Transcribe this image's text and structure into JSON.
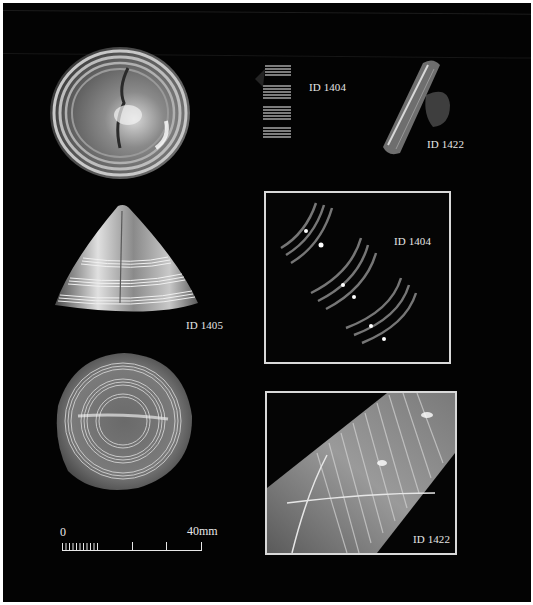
{
  "figure": {
    "background": "#030303",
    "border_color": "#ffffff",
    "frame_color": "#d9d9d9"
  },
  "artifacts": [
    {
      "id": "disc-top-left",
      "type": "round disc with concentric rings"
    },
    {
      "id": "coil-1404",
      "label": "ID 1404",
      "type": "spiral coil fragment"
    },
    {
      "id": "tube-1422",
      "label": "ID 1422",
      "type": "tube fragment"
    },
    {
      "id": "cone-1405",
      "label": "ID 1405",
      "type": "conical ornament with banded rings"
    },
    {
      "id": "disc-bottom-left",
      "type": "round disc with concentric rings"
    }
  ],
  "details": [
    {
      "label": "ID 1404",
      "type": "close-up of coil windings"
    },
    {
      "label": "ID 1422",
      "type": "close-up of ribbed tube with fibres"
    }
  ],
  "labels": {
    "coil_top": "ID 1404",
    "tube_top": "ID 1422",
    "cone": "ID 1405",
    "detail_1404": "ID 1404",
    "detail_1422": "ID 1422"
  },
  "scale_bar": {
    "start_label": "0",
    "end_label": "40mm",
    "minor_ticks": 10,
    "major_ticks": 3
  }
}
